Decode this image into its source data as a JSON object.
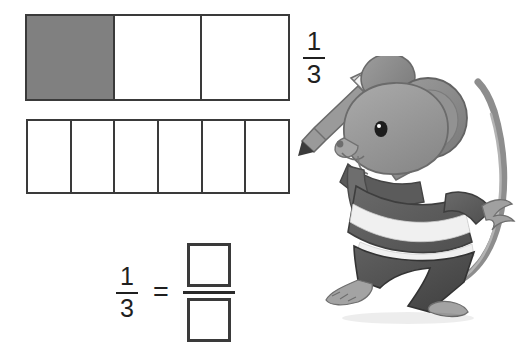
{
  "worksheet": {
    "title": "Fraction equivalence bar model worksheet",
    "bar_thirds": {
      "name": "thirds-bar",
      "total_cells": 3,
      "shaded_cells": 1,
      "cells": [
        {
          "index": 1,
          "shaded": true,
          "label": ""
        },
        {
          "index": 2,
          "shaded": false,
          "label": ""
        },
        {
          "index": 3,
          "shaded": false,
          "label": ""
        }
      ],
      "fraction_label": {
        "numerator": "1",
        "denominator": "3"
      }
    },
    "bar_sixths": {
      "name": "sixths-bar",
      "total_cells": 6,
      "shaded_cells": 0,
      "cells": [
        {
          "index": 1,
          "shaded": false,
          "label": ""
        },
        {
          "index": 2,
          "shaded": false,
          "label": ""
        },
        {
          "index": 3,
          "shaded": false,
          "label": ""
        },
        {
          "index": 4,
          "shaded": false,
          "label": ""
        },
        {
          "index": 5,
          "shaded": false,
          "label": ""
        },
        {
          "index": 6,
          "shaded": false,
          "label": ""
        }
      ]
    },
    "equation": {
      "left_fraction": {
        "numerator": "1",
        "denominator": "3"
      },
      "equals": "=",
      "right_fraction": {
        "numerator": "",
        "denominator": ""
      }
    },
    "mascot": {
      "name": "mouse-with-pencil",
      "description": "grayscale cartoon mouse holding a pencil, striped shirt, dark pants, curved tail"
    }
  },
  "colors": {
    "shaded_cell": "#808080",
    "cell_border": "#3a3a3a",
    "text": "#1f1f1f",
    "background": "#ffffff",
    "mouse_fur": "#9b9b9b",
    "mouse_fur_dark": "#7d7d7d",
    "mouse_clothes_dark": "#5e5e5e",
    "mouse_clothes_light": "#f2f2f2"
  }
}
